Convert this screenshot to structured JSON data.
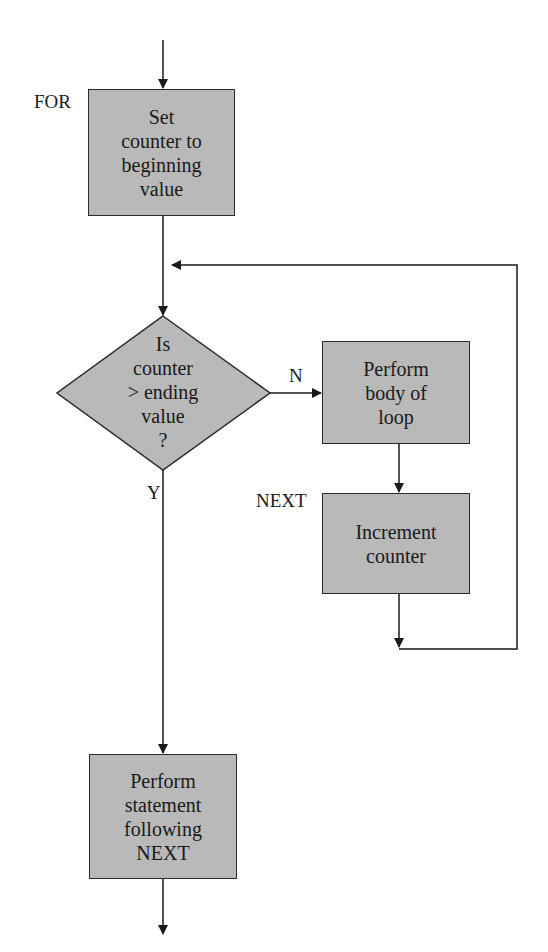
{
  "diagram": {
    "type": "flowchart",
    "colors": {
      "box_fill": "#b9b9b9",
      "stroke": "#2a2a2a",
      "background": "#ffffff"
    },
    "labels": {
      "for": "FOR",
      "next": "NEXT",
      "no": "N",
      "yes": "Y"
    },
    "nodes": {
      "init": {
        "kind": "process",
        "lines": [
          "Set",
          "counter to",
          "beginning",
          "value"
        ]
      },
      "decision": {
        "kind": "decision",
        "lines": [
          "Is",
          "counter",
          "> ending",
          "value",
          "?"
        ]
      },
      "body": {
        "kind": "process",
        "lines": [
          "Perform",
          "body of",
          "loop"
        ]
      },
      "increment": {
        "kind": "process",
        "lines": [
          "Increment",
          "counter"
        ]
      },
      "after": {
        "kind": "process",
        "lines": [
          "Perform",
          "statement",
          "following",
          "NEXT"
        ]
      }
    },
    "edges": [
      {
        "from": "entry",
        "to": "init"
      },
      {
        "from": "init",
        "to": "decision"
      },
      {
        "from": "decision",
        "to": "body",
        "label": "N"
      },
      {
        "from": "body",
        "to": "increment"
      },
      {
        "from": "increment",
        "to": "decision",
        "note": "loop back"
      },
      {
        "from": "decision",
        "to": "after",
        "label": "Y"
      },
      {
        "from": "after",
        "to": "exit"
      }
    ]
  }
}
